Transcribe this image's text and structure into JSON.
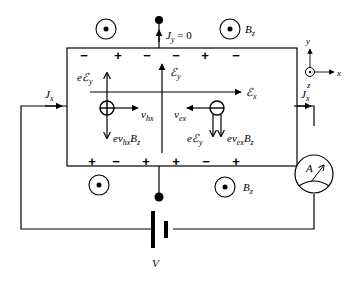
{
  "labels": {
    "jy": "J",
    "jy_sub": "y",
    "jy_eq": " = 0",
    "bz": "B",
    "bz_sub": "z",
    "jx": "J",
    "jx_sub": "x",
    "ey_field": "ℰ",
    "ey_field_sub": "y",
    "ex_field": "ℰ",
    "ex_field_sub": "x",
    "e_ey_hole": "eℰ",
    "e_ey_hole_sub": "y",
    "v_hx": "v",
    "v_hx_sub": "hx",
    "ev_hx_bz": "ev",
    "ev_hx_bz_sub": "hx",
    "ev_hx_bz_b": "B",
    "ev_hx_bz_b_sub": "z",
    "v_ex": "v",
    "v_ex_sub": "ex",
    "e_ey_elec": "eℰ",
    "e_ey_elec_sub": "y",
    "ev_ex_bz": "ev",
    "ev_ex_bz_sub": "ex",
    "ev_ex_bz_b": "B",
    "ev_ex_bz_b_sub": "z",
    "ammeter": "A",
    "voltage": "V",
    "axis_x": "x",
    "axis_y": "y",
    "axis_z": "z"
  },
  "top_charges": [
    "−",
    "+",
    "−",
    "−",
    "+",
    "−"
  ],
  "bottom_charges": [
    "+",
    "−",
    "+",
    "+",
    "−",
    "+"
  ]
}
